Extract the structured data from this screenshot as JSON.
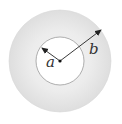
{
  "diagram": {
    "type": "concentric-circles",
    "labels": {
      "inner_radius": "a",
      "outer_radius": "b"
    },
    "colors": {
      "outer_fill": "#e4e4e4",
      "outer_fill_center": "#f2f2f2",
      "inner_fill": "#ffffff",
      "inner_stroke": "#9a9a9a",
      "arrow": "#222222"
    }
  }
}
